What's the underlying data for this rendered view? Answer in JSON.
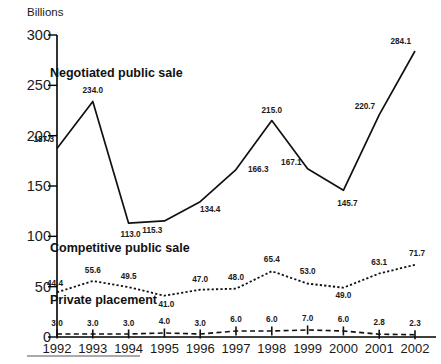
{
  "chart_data": {
    "type": "line",
    "title": "",
    "xlabel": "",
    "ylabel": "Billions",
    "yunit_label": "Billions",
    "categories": [
      "1992",
      "1993",
      "1994",
      "1995",
      "1996",
      "1997",
      "1998",
      "1999",
      "2000",
      "2001",
      "2002"
    ],
    "ylim": [
      0,
      300
    ],
    "yticks": [
      0,
      50,
      100,
      150,
      200,
      250,
      300
    ],
    "ytick_labels": [
      "0",
      "50",
      "100",
      "150",
      "200",
      "250",
      "300"
    ],
    "grid": false,
    "legend": "inline-labels",
    "series": [
      {
        "name": "Negotiated public sale",
        "style": "solid",
        "label_position": "upper-left",
        "values": [
          187.3,
          234.0,
          113.0,
          115.3,
          134.4,
          166.3,
          215.0,
          167.1,
          145.7,
          220.7,
          284.1
        ],
        "value_labels": [
          "187.3",
          "234.0",
          "113.0",
          "115.3",
          "134.4",
          "166.3",
          "215.0",
          "167.1",
          "145.7",
          "220.7",
          "284.1"
        ]
      },
      {
        "name": "Competitive public sale",
        "style": "dotted",
        "label_position": "middle-left",
        "values": [
          44.4,
          55.6,
          49.5,
          41.0,
          47.0,
          48.0,
          65.4,
          53.0,
          49.0,
          63.1,
          71.7
        ],
        "value_labels": [
          "44.4",
          "55.6",
          "49.5",
          "41.0",
          "47.0",
          "48.0",
          "65.4",
          "53.0",
          "49.0",
          "63.1",
          "71.7"
        ]
      },
      {
        "name": "Private placement",
        "style": "dashed",
        "label_position": "lower-left",
        "values": [
          3.0,
          3.0,
          3.0,
          4.0,
          3.0,
          6.0,
          6.0,
          7.0,
          6.0,
          2.8,
          2.3
        ],
        "value_labels": [
          "3.0",
          "3.0",
          "3.0",
          "4.0",
          "3.0",
          "6.0",
          "6.0",
          "7.0",
          "6.0",
          "2.8",
          "2.3"
        ]
      }
    ],
    "colors": {
      "line": "#111111",
      "axis": "#000000",
      "text": "#1a1a1a",
      "footer_rule": "#8c8c8c"
    }
  }
}
